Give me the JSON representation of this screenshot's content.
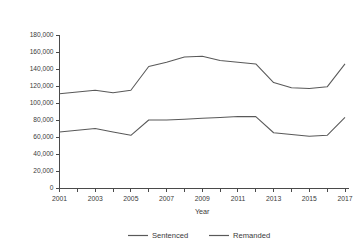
{
  "chart_data": {
    "type": "line",
    "title": "",
    "subtitle": "",
    "xlabel": "Year",
    "ylabel": "",
    "x": [
      2001,
      2002,
      2003,
      2004,
      2005,
      2006,
      2007,
      2008,
      2009,
      2010,
      2011,
      2012,
      2013,
      2014,
      2015,
      2016,
      2017
    ],
    "xlim": [
      2001,
      2017
    ],
    "ylim": [
      0,
      180000
    ],
    "y_ticks": [
      0,
      20000,
      40000,
      60000,
      80000,
      100000,
      120000,
      140000,
      160000,
      180000
    ],
    "y_tick_labels": [
      "0",
      "20,000",
      "40,000",
      "60,000",
      "80,000",
      "100,000",
      "120,000",
      "140,000",
      "160,000",
      "180,000"
    ],
    "x_ticks": [
      2001,
      2002,
      2003,
      2004,
      2005,
      2006,
      2007,
      2008,
      2009,
      2010,
      2011,
      2012,
      2013,
      2014,
      2015,
      2016,
      2017
    ],
    "x_tick_labels": [
      "2001",
      "",
      "2003",
      "",
      "2005",
      "",
      "2007",
      "",
      "2009",
      "",
      "2011",
      "",
      "2013",
      "",
      "2015",
      "",
      "2017"
    ],
    "grid": false,
    "legend_position": "bottom",
    "series": [
      {
        "name": "Sentenced",
        "color": "#595959",
        "values": [
          111000,
          113000,
          115000,
          112000,
          115000,
          143000,
          148000,
          154000,
          155000,
          150000,
          148000,
          146000,
          124000,
          118000,
          117000,
          119000,
          146000
        ]
      },
      {
        "name": "Remanded",
        "color": "#595959",
        "values": [
          66000,
          68000,
          70000,
          66000,
          62000,
          80000,
          80000,
          81000,
          82000,
          83000,
          84000,
          84000,
          65000,
          63000,
          61000,
          62000,
          83000
        ]
      }
    ]
  },
  "legend": {
    "items": [
      {
        "label": "Sentenced"
      },
      {
        "label": "Remanded"
      }
    ]
  },
  "axes": {
    "x_axis_title": "Year"
  }
}
